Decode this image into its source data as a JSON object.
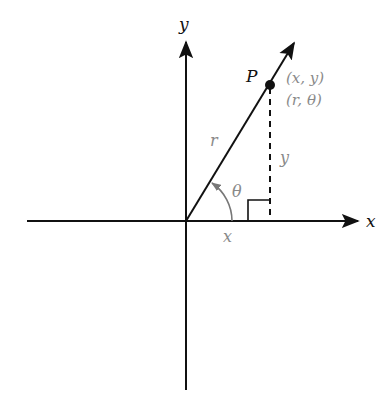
{
  "diagram": {
    "axes": {
      "x_label": "x",
      "y_label": "y"
    },
    "point": {
      "name": "P",
      "rect_coords": "(x, y)",
      "polar_coords": "(r, θ)"
    },
    "labels": {
      "radius": "r",
      "angle": "θ",
      "horizontal_leg": "x",
      "vertical_leg": "y"
    },
    "colors": {
      "line": "#111111",
      "label_gray": "#8a8a8a"
    }
  }
}
